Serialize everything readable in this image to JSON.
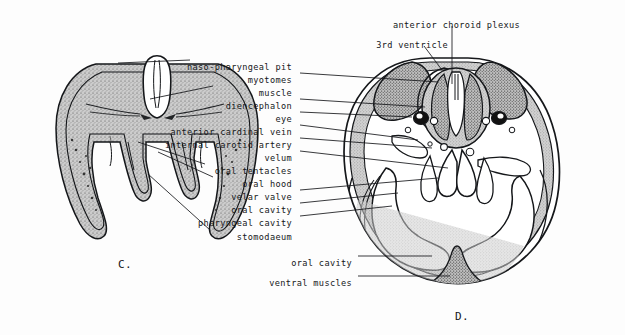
{
  "figure": {
    "type": "anatomical-cross-section-plate",
    "background": "#fdfdfd",
    "ink": "#15171a",
    "tissue_fill": "#c9c9c9",
    "panels": [
      {
        "id": "C",
        "caption": "C.",
        "x": 118,
        "y": 258
      },
      {
        "id": "D",
        "caption": "D.",
        "x": 455,
        "y": 310
      }
    ]
  },
  "labels": {
    "top": [
      {
        "text": "anterior choroid plexus",
        "x": 520,
        "y": 20,
        "align": "right"
      },
      {
        "text": "3rd ventricle",
        "x": 448,
        "y": 40,
        "align": "right"
      }
    ],
    "column": [
      {
        "text": "naso-pharyngeal pit",
        "x": 292,
        "y": 62,
        "align": "right"
      },
      {
        "text": "myotomes",
        "x": 292,
        "y": 75,
        "align": "right"
      },
      {
        "text": "muscle",
        "x": 292,
        "y": 88,
        "align": "right"
      },
      {
        "text": "diencephalon",
        "x": 292,
        "y": 101,
        "align": "right"
      },
      {
        "text": "eye",
        "x": 292,
        "y": 114,
        "align": "right"
      },
      {
        "text": "anterior cardinal vein",
        "x": 292,
        "y": 127,
        "align": "right"
      },
      {
        "text": "internal carotid artery",
        "x": 292,
        "y": 140,
        "align": "right"
      },
      {
        "text": "velum",
        "x": 292,
        "y": 153,
        "align": "right"
      },
      {
        "text": "oral tentacles",
        "x": 292,
        "y": 166,
        "align": "right"
      },
      {
        "text": "oral hood",
        "x": 292,
        "y": 179,
        "align": "right"
      },
      {
        "text": "velar valve",
        "x": 292,
        "y": 192,
        "align": "right"
      },
      {
        "text": "oral cavity",
        "x": 292,
        "y": 205,
        "align": "right"
      },
      {
        "text": "pharyngeal cavity",
        "x": 292,
        "y": 218,
        "align": "right"
      },
      {
        "text": "stomodaeum",
        "x": 292,
        "y": 232,
        "align": "right"
      }
    ],
    "bottom": [
      {
        "text": "oral cavity",
        "x": 352,
        "y": 258,
        "align": "right"
      },
      {
        "text": "ventral muscles",
        "x": 352,
        "y": 278,
        "align": "right"
      }
    ]
  },
  "leaders": {
    "to_panel_c": [
      {
        "label": "naso-pharyngeal pit",
        "from": [
          190,
          60
        ],
        "to": [
          118,
          63
        ]
      },
      {
        "label": "muscle",
        "from": [
          213,
          86
        ],
        "to": [
          150,
          99
        ]
      },
      {
        "label": "oral tentacles",
        "from": [
          205,
          164
        ],
        "to": [
          138,
          142
        ]
      },
      {
        "label": "oral hood",
        "from": [
          213,
          177
        ],
        "to": [
          158,
          152
        ]
      },
      {
        "label": "stomodaeum",
        "from": [
          210,
          230
        ],
        "to": [
          148,
          174
        ]
      }
    ],
    "to_panel_d": [
      {
        "label": "anterior choroid plexus",
        "from": [
          452,
          26
        ],
        "to": [
          452,
          84
        ]
      },
      {
        "label": "3rd ventricle",
        "from": [
          424,
          46
        ],
        "to": [
          442,
          70
        ]
      },
      {
        "label": "myotomes",
        "from": [
          300,
          73
        ],
        "to": [
          438,
          82
        ]
      },
      {
        "label": "diencephalon",
        "from": [
          300,
          99
        ],
        "to": [
          425,
          107
        ]
      },
      {
        "label": "eye",
        "from": [
          300,
          112
        ],
        "to": [
          412,
          117
        ]
      },
      {
        "label": "anterior cardinal vein",
        "from": [
          300,
          125
        ],
        "to": [
          418,
          140
        ]
      },
      {
        "label": "internal carotid artery",
        "from": [
          300,
          138
        ],
        "to": [
          432,
          148
        ]
      },
      {
        "label": "velum",
        "from": [
          300,
          151
        ],
        "to": [
          448,
          168
        ]
      },
      {
        "label": "velar valve",
        "from": [
          300,
          190
        ],
        "to": [
          438,
          178
        ]
      },
      {
        "label": "oral cavity",
        "from": [
          300,
          203
        ],
        "to": [
          398,
          193
        ]
      },
      {
        "label": "pharyngeal cavity",
        "from": [
          300,
          216
        ],
        "to": [
          392,
          206
        ]
      },
      {
        "label": "oral cavity (ventral)",
        "from": [
          358,
          256
        ],
        "to": [
          432,
          256
        ]
      },
      {
        "label": "ventral muscles",
        "from": [
          358,
          276
        ],
        "to": [
          450,
          276
        ]
      }
    ]
  },
  "panel_c": {
    "description": "Transverse section of larval head: dome-shaped body wall with stippled tissue, deep U-shaped stomodaeal cavity, paired oral tentacles, median naso-pharyngeal pit at apex"
  },
  "panel_d": {
    "description": "Transverse section at level of diencephalon: circular body with paired dorsal myotomes, central brain with 3rd ventricle and anterior choroid plexus, paired pigmented eyes, oral hood enclosing oral and pharyngeal cavities, velum with velar valve, ventral muscles"
  }
}
